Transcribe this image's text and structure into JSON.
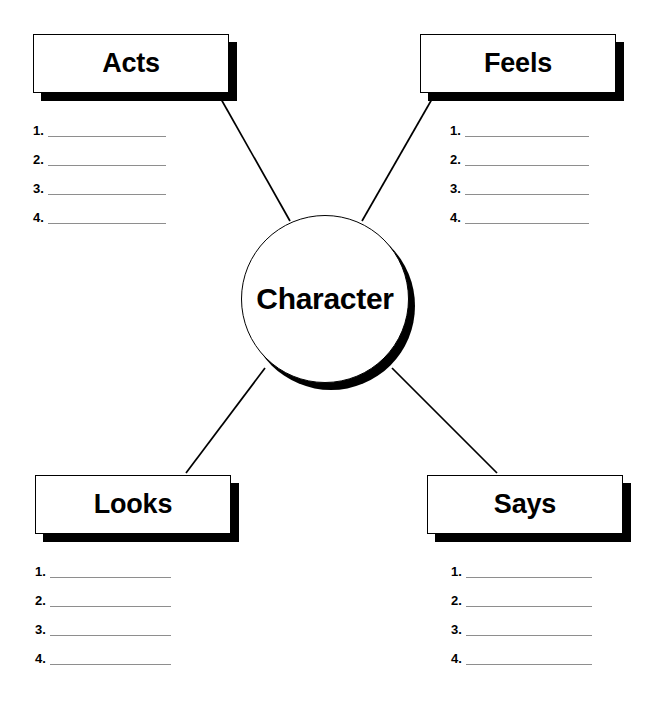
{
  "worksheet": {
    "center": {
      "label": "Character"
    },
    "quadrants": [
      {
        "key": "acts",
        "title": "Acts",
        "items": [
          "1.",
          "2.",
          "3.",
          "4."
        ]
      },
      {
        "key": "feels",
        "title": "Feels",
        "items": [
          "1.",
          "2.",
          "3.",
          "4."
        ]
      },
      {
        "key": "looks",
        "title": "Looks",
        "items": [
          "1.",
          "2.",
          "3.",
          "4."
        ]
      },
      {
        "key": "says",
        "title": "Says",
        "items": [
          "1.",
          "2.",
          "3.",
          "4."
        ]
      }
    ],
    "colors": {
      "ink": "#000000",
      "paper": "#ffffff",
      "rule": "#8e8e8e"
    }
  }
}
